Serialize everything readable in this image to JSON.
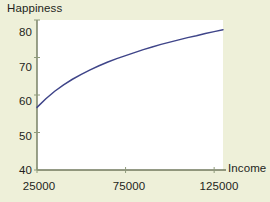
{
  "chart_data": {
    "type": "line",
    "title": "",
    "xlabel": "Income",
    "ylabel": "Happiness",
    "xlim": [
      25000,
      130000
    ],
    "ylim": [
      40,
      80
    ],
    "xticks": [
      25000,
      75000,
      125000
    ],
    "xtick_labels": [
      "25000",
      "75000",
      "125000"
    ],
    "yticks": [
      40,
      50,
      60,
      70,
      80
    ],
    "ytick_labels": [
      "40",
      "50",
      "60",
      "70",
      "80"
    ],
    "grid": false,
    "legend": false,
    "series": [
      {
        "name": "Happiness vs Income",
        "color": "#3f4589",
        "x": [
          25000,
          30000,
          35000,
          40000,
          45000,
          50000,
          55000,
          60000,
          65000,
          70000,
          75000,
          80000,
          85000,
          90000,
          95000,
          100000,
          105000,
          110000,
          115000,
          120000,
          125000,
          130000
        ],
        "y": [
          56.7,
          59.0,
          61.0,
          62.7,
          64.2,
          65.5,
          66.7,
          67.8,
          68.8,
          69.7,
          70.5,
          71.3,
          72.1,
          72.8,
          73.5,
          74.1,
          74.7,
          75.3,
          75.8,
          76.4,
          76.9,
          77.4
        ]
      }
    ]
  },
  "axis_titles": {
    "y": "Happiness",
    "x": "Income"
  },
  "style": {
    "figure_background": "#eef0d9",
    "plot_background": "#ffffff",
    "axis_color": "#6f7a5e",
    "line_color": "#3f4589",
    "text_color": "#231f20"
  },
  "ytick_labels": {
    "t0": "40",
    "t1": "50",
    "t2": "60",
    "t3": "70",
    "t4": "80"
  },
  "xtick_labels": {
    "t0": "25000",
    "t1": "75000",
    "t2": "125000"
  }
}
